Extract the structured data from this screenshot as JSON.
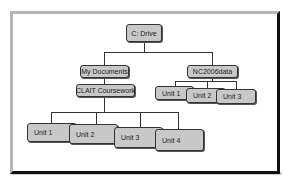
{
  "diagram": {
    "type": "folder-tree",
    "root": {
      "label": "C: Drive"
    },
    "level1": [
      {
        "label": "My Documents"
      },
      {
        "label": "NC2006data"
      }
    ],
    "my_documents_child": {
      "label": "CLAIT Coursework"
    },
    "clait_children": [
      {
        "label": "Unit 1"
      },
      {
        "label": "Unit 2"
      },
      {
        "label": "Unit 3"
      },
      {
        "label": "Unit 4"
      }
    ],
    "nc2006data_children": [
      {
        "label": "Unit 1"
      },
      {
        "label": "Unit 2"
      },
      {
        "label": "Unit 3"
      }
    ],
    "colors": {
      "node_fill": "#c8c8c8",
      "node_border": "#333333",
      "line": "#333333"
    }
  }
}
